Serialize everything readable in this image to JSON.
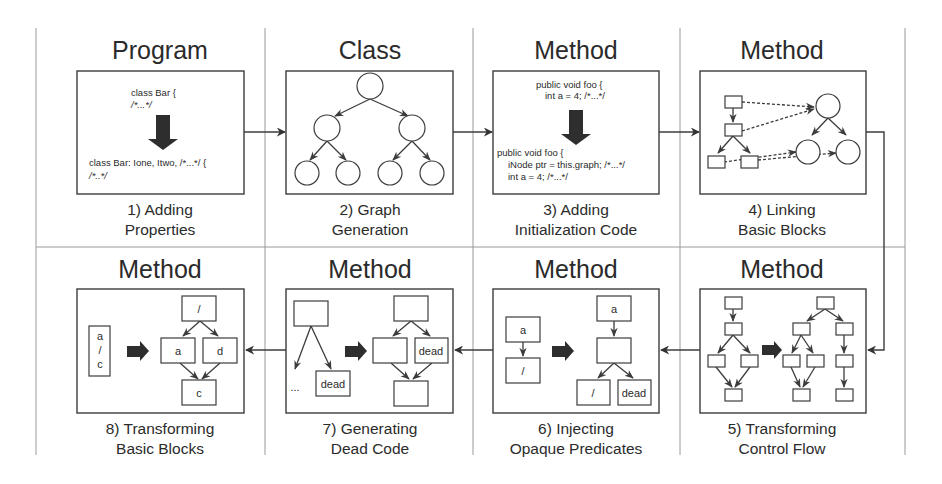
{
  "diagram": {
    "grid": {
      "color": "#9a9a9a"
    },
    "panels": [
      {
        "step": 1,
        "scope": "Program",
        "caption_line1": "1) Adding",
        "caption_line2": "Properties",
        "code_before": [
          "class Bar {",
          "/*...*/"
        ],
        "code_after": [
          "class Bar: Ione, Itwo, /*...*/ {",
          "/*..*/"
        ]
      },
      {
        "step": 2,
        "scope": "Class",
        "caption_line1": "2) Graph",
        "caption_line2": "Generation",
        "graph": "binary tree of 7 circular nodes"
      },
      {
        "step": 3,
        "scope": "Method",
        "caption_line1": "3) Adding",
        "caption_line2": "Initialization Code",
        "code_before": [
          "public void foo {",
          "int a = 4; /*...*/"
        ],
        "code_after": [
          "public void foo {",
          "iNode ptr = this.graph; /*...*/",
          "int a = 4; /*...*/"
        ]
      },
      {
        "step": 4,
        "scope": "Method",
        "caption_line1": "4) Linking",
        "caption_line2": "Basic Blocks",
        "graph": "basic blocks linked by dashed edges to graph nodes"
      },
      {
        "step": 5,
        "scope": "Method",
        "caption_line1": "5) Transforming",
        "caption_line2": "Control Flow",
        "graph": "control flow graph expanded"
      },
      {
        "step": 6,
        "scope": "Method",
        "caption_line1": "6) Injecting",
        "caption_line2": "Opaque Predicates",
        "nodes_before": [
          "a",
          "/"
        ],
        "nodes_after": [
          "a",
          "",
          "/",
          "dead"
        ]
      },
      {
        "step": 7,
        "scope": "Method",
        "caption_line1": "7) Generating",
        "caption_line2": "Dead Code",
        "nodes_before": [
          "",
          "...",
          "dead"
        ],
        "nodes_after": [
          "",
          "",
          "dead",
          ""
        ]
      },
      {
        "step": 8,
        "scope": "Method",
        "caption_line1": "8) Transforming",
        "caption_line2": "Basic Blocks",
        "nodes_before": [
          "a",
          "/",
          "c"
        ],
        "nodes_after": [
          "/",
          "a",
          "d",
          "c"
        ]
      }
    ]
  }
}
